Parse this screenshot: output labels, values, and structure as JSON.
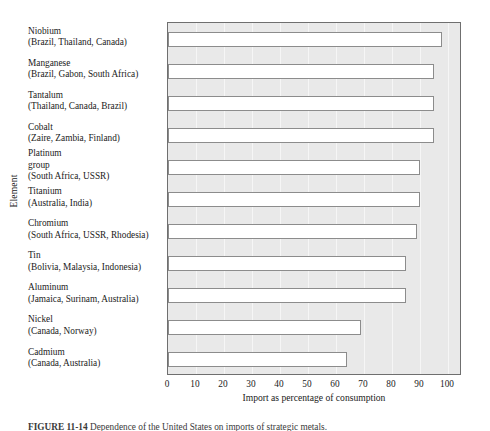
{
  "chart_data": {
    "type": "bar",
    "orientation": "horizontal",
    "title": "",
    "xlabel": "Import as percentage of consumption",
    "ylabel": "Element",
    "xlim": [
      0,
      105
    ],
    "xticks": [
      0,
      10,
      20,
      30,
      40,
      50,
      60,
      70,
      80,
      90,
      100
    ],
    "grid": "vertical",
    "legend": "none",
    "categories": [
      "Niobium\n(Brazil, Thailand, Canada)",
      "Manganese\n(Brazil, Gabon, South Africa)",
      "Tantalum\n(Thailand, Canada, Brazil)",
      "Cobalt\n(Zaire, Zambia, Finland)",
      "Platinum group\n(South Africa, USSR)",
      "Titanium\n(Australia, India)",
      "Chromium\n(South Africa, USSR, Rhodesia)",
      "Tin\n(Bolivia, Malaysia, Indonesia)",
      "Aluminum\n(Jamaica, Surinam, Australia)",
      "Nickel\n(Canada, Norway)",
      "Cadmium\n(Canada, Australia)"
    ],
    "values": [
      98,
      95,
      95,
      95,
      90,
      90,
      89,
      85,
      85,
      69,
      64
    ],
    "bars": [
      {
        "name": "Niobium",
        "sources": "(Brazil, Thailand, Canada)",
        "value": 98
      },
      {
        "name": "Manganese",
        "sources": "(Brazil, Gabon, South Africa)",
        "value": 95
      },
      {
        "name": "Tantalum",
        "sources": "(Thailand, Canada, Brazil)",
        "value": 95
      },
      {
        "name": "Cobalt",
        "sources": "(Zaire, Zambia, Finland)",
        "value": 95
      },
      {
        "name": "Platinum group",
        "sources": "(South Africa, USSR)",
        "value": 90
      },
      {
        "name": "Titanium",
        "sources": "(Australia, India)",
        "value": 90
      },
      {
        "name": "Chromium",
        "sources": "(South Africa, USSR, Rhodesia)",
        "value": 89
      },
      {
        "name": "Tin",
        "sources": "(Bolivia, Malaysia, Indonesia)",
        "value": 85
      },
      {
        "name": "Aluminum",
        "sources": "(Jamaica, Surinam, Australia)",
        "value": 85
      },
      {
        "name": "Nickel",
        "sources": "(Canada, Norway)",
        "value": 69
      },
      {
        "name": "Cadmium",
        "sources": "(Canada, Australia)",
        "value": 64
      }
    ],
    "colors": {
      "bar_fill": "#ffffff",
      "bar_edge": "#8c8c8c",
      "plot_background": "#e9e9e9",
      "gridline": "#f6f6f6",
      "axis_frame": "#6f6f6f",
      "text": "#1a1a1a"
    }
  },
  "labels": {
    "rows": [
      {
        "line1": "Niobium",
        "line2": "",
        "line3": "(Brazil, Thailand, Canada)"
      },
      {
        "line1": "Manganese",
        "line2": "",
        "line3": "(Brazil, Gabon, South Africa)"
      },
      {
        "line1": "Tantalum",
        "line2": "",
        "line3": "(Thailand, Canada, Brazil)"
      },
      {
        "line1": "Cobalt",
        "line2": "",
        "line3": "(Zaire, Zambia, Finland)"
      },
      {
        "line1": "Platinum",
        "line2": "group",
        "line3": "(South Africa, USSR)"
      },
      {
        "line1": "Titanium",
        "line2": "",
        "line3": "(Australia, India)"
      },
      {
        "line1": "Chromium",
        "line2": "",
        "line3": "(South Africa, USSR, Rhodesia)"
      },
      {
        "line1": "Tin",
        "line2": "",
        "line3": "(Bolivia, Malaysia, Indonesia)"
      },
      {
        "line1": "Aluminum",
        "line2": "",
        "line3": "(Jamaica, Surinam, Australia)"
      },
      {
        "line1": "Nickel",
        "line2": "",
        "line3": "(Canada, Norway)"
      },
      {
        "line1": "Cadmium",
        "line2": "",
        "line3": "(Canada, Australia)"
      }
    ]
  },
  "axes": {
    "y_title": "Element",
    "x_title": "Import as percentage of consumption",
    "x_tick_labels": [
      "0",
      "10",
      "20",
      "30",
      "40",
      "50",
      "60",
      "70",
      "80",
      "90",
      "100"
    ]
  },
  "caption": {
    "label": "FIGURE 11-14",
    "text": "Dependence of the United States on imports of strategic metals."
  }
}
